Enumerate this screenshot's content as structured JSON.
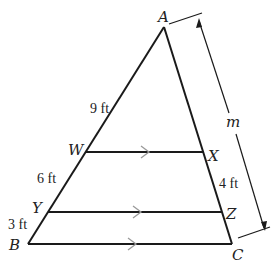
{
  "figure": {
    "type": "triangle with parallel segments",
    "vertices": {
      "A": {
        "label": "A",
        "x": 164,
        "y": 27
      },
      "B": {
        "label": "B",
        "x": 28,
        "y": 244
      },
      "C": {
        "label": "C",
        "x": 232,
        "y": 244
      }
    },
    "points_on_AB": {
      "W": {
        "label": "W",
        "x": 86,
        "y": 152
      },
      "Y": {
        "label": "Y",
        "x": 48,
        "y": 212
      }
    },
    "points_on_AC": {
      "X": {
        "label": "X",
        "x": 204,
        "y": 152
      },
      "Z": {
        "label": "Z",
        "x": 222,
        "y": 212
      }
    },
    "parallel_segments": [
      "WX",
      "YZ",
      "BC"
    ],
    "measurements": {
      "AW": "9 ft",
      "WY": "6 ft",
      "YB": "3 ft",
      "XZ": "4 ft",
      "AC": "m"
    },
    "colors": {
      "lines": "#1a1a1a",
      "parallel_marks": "#9a9a9a",
      "text": "#222222"
    }
  }
}
